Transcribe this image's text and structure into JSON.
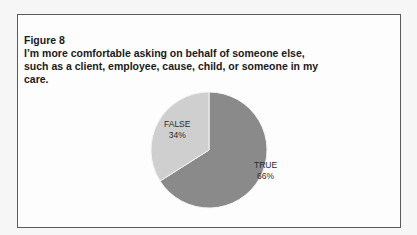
{
  "figure": {
    "label": "Figure 8",
    "title": "I’m more comfortable asking on behalf of someone else, such as a client, employee, cause, child, or someone in my care."
  },
  "chart_data": {
    "type": "pie",
    "title": "I’m more comfortable asking on behalf of someone else, such as a client, employee, cause, child, or someone in my care.",
    "categories": [
      "TRUE",
      "FALSE"
    ],
    "values": [
      66,
      34
    ],
    "labels": [
      "TRUE 66%",
      "FALSE 34%"
    ],
    "colors": [
      "#8a8a8a",
      "#cfcfcf"
    ],
    "legend": "none (data labels inside slices)"
  },
  "slices": [
    {
      "name": "TRUE",
      "pct": "66%"
    },
    {
      "name": "FALSE",
      "pct": "34%"
    }
  ]
}
